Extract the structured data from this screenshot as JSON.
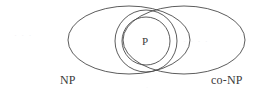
{
  "figure": {
    "kind": "venn-diagram",
    "background_color": "#ffffff",
    "stroke_color": "#4a4a4a",
    "text_color": "#3a3a3a",
    "width": 258,
    "height": 92
  },
  "labels": {
    "left_set": "NP",
    "right_set": "co-NP",
    "center_set": "P"
  },
  "sets": [
    {
      "name": "NP",
      "shape": "ellipse",
      "position": "left",
      "cx": 129,
      "cy": 40,
      "rx": 61,
      "ry": 34
    },
    {
      "name": "co-NP",
      "shape": "ellipse",
      "position": "right",
      "cx": 184,
      "cy": 40,
      "rx": 61,
      "ry": 34
    },
    {
      "name": "intersection-outer",
      "shape": "circle",
      "position": "center",
      "cx": 146,
      "cy": 41,
      "r": 31
    },
    {
      "name": "P",
      "shape": "circle",
      "position": "center",
      "cx": 146,
      "cy": 41,
      "r": 24
    }
  ],
  "artifacts": {
    "left_smudge": "· · ·",
    "right_smudge": "· · · ·",
    "bottom_speck": "·"
  }
}
